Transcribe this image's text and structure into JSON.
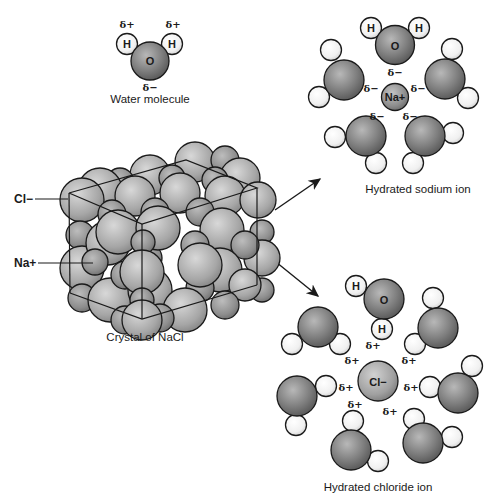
{
  "diagram": {
    "colors": {
      "oxygen": "#7a7a7a",
      "hydrogen": "#f2f2f2",
      "sodium": "#8a8a8a",
      "chloride": "#9a9a9a",
      "crystal": "#a8a8a8",
      "stroke": "#1a1a1a"
    },
    "water_molecule": {
      "caption": "Water molecule",
      "oxygen_label": "O",
      "hydrogen_label": "H",
      "partial_positive": "δ+",
      "partial_negative": "δ−"
    },
    "crystal": {
      "caption": "Crystal of NaCl",
      "chloride_label": "Cl−",
      "sodium_label": "Na+"
    },
    "hydrated_sodium": {
      "caption": "Hydrated sodium ion",
      "ion_label": "Na+",
      "oxygen_label": "O",
      "hydrogen_label": "H",
      "partial_negative": "δ−",
      "water_count": 5
    },
    "hydrated_chloride": {
      "caption": "Hydrated chloride ion",
      "ion_label": "Cl−",
      "oxygen_label": "O",
      "hydrogen_label": "H",
      "partial_positive": "δ+",
      "water_count": 7
    }
  }
}
